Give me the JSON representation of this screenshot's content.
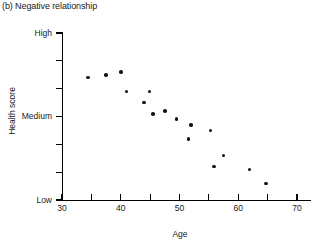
{
  "chart_data": {
    "type": "scatter",
    "title": "(b) Negative relationship",
    "xlabel": "Age",
    "ylabel": "Health score",
    "xlim": [
      30,
      70
    ],
    "ylim": [
      0,
      6
    ],
    "grid": false,
    "legend": null,
    "x_ticks": [
      30,
      35,
      40,
      45,
      50,
      55,
      60,
      65,
      70
    ],
    "x_tick_labels": [
      "30",
      "",
      "40",
      "",
      "50",
      "",
      "60",
      "",
      "70"
    ],
    "y_ticks": [
      0,
      1,
      2,
      3,
      4,
      5,
      6
    ],
    "y_tick_labels": [
      "Low",
      "",
      "",
      "Medium",
      "",
      "",
      "High"
    ],
    "point_color": "#111111",
    "axis_color": "#000000",
    "background": "#ffffff",
    "points": [
      {
        "x": 34.4,
        "y": 4.4
      },
      {
        "x": 37.5,
        "y": 4.5
      },
      {
        "x": 40.0,
        "y": 4.6
      },
      {
        "x": 41.0,
        "y": 3.9
      },
      {
        "x": 44.0,
        "y": 3.5
      },
      {
        "x": 44.9,
        "y": 3.9
      },
      {
        "x": 45.5,
        "y": 3.1
      },
      {
        "x": 47.5,
        "y": 3.2
      },
      {
        "x": 49.5,
        "y": 2.9
      },
      {
        "x": 52.0,
        "y": 2.7
      },
      {
        "x": 51.5,
        "y": 2.2
      },
      {
        "x": 55.3,
        "y": 2.5
      },
      {
        "x": 57.5,
        "y": 1.6
      },
      {
        "x": 55.9,
        "y": 1.2
      },
      {
        "x": 61.9,
        "y": 1.1
      },
      {
        "x": 64.7,
        "y": 0.6
      }
    ]
  }
}
